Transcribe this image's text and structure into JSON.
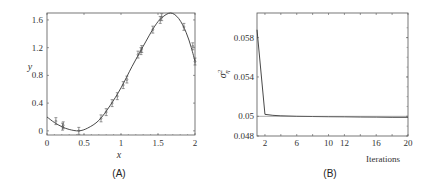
{
  "chart_data": [
    {
      "panel": "(A)",
      "type": "scatter",
      "title": "",
      "xlabel": "x",
      "ylabel": "y",
      "xlim": [
        0,
        2
      ],
      "ylim": [
        -0.06,
        1.7
      ],
      "xticks": [
        "0",
        "0.5",
        "1",
        "1.5",
        "2"
      ],
      "yticks": [
        "0",
        "0.4",
        "0.8",
        "1.2",
        "1.6"
      ],
      "grid": false,
      "series": [
        {
          "name": "fitted curve",
          "kind": "line",
          "x": [
            0,
            0.1,
            0.2,
            0.3,
            0.43,
            0.55,
            0.7,
            0.85,
            1.0,
            1.15,
            1.3,
            1.45,
            1.55,
            1.67,
            1.78,
            1.88,
            1.95,
            2.0
          ],
          "y": [
            0.2,
            0.12,
            0.06,
            0.02,
            0.0,
            0.04,
            0.15,
            0.36,
            0.62,
            0.93,
            1.22,
            1.5,
            1.63,
            1.7,
            1.62,
            1.42,
            1.2,
            1.0
          ]
        },
        {
          "name": "observations",
          "kind": "errorbar",
          "x": [
            0.12,
            0.21,
            0.22,
            0.43,
            0.73,
            0.8,
            0.88,
            0.95,
            1.03,
            1.08,
            1.23,
            1.27,
            1.28,
            1.43,
            1.53,
            1.55,
            1.85,
            1.97,
            2.0
          ],
          "y": [
            0.14,
            0.06,
            0.08,
            0.0,
            0.18,
            0.27,
            0.4,
            0.5,
            0.66,
            0.74,
            1.1,
            1.15,
            1.18,
            1.46,
            1.6,
            1.64,
            1.5,
            1.22,
            1.0
          ],
          "err": 0.05
        }
      ],
      "caption": "(A)"
    },
    {
      "panel": "(B)",
      "type": "line",
      "title": "",
      "xlabel": "Iterations",
      "ylabel": "σ²η",
      "xlim": [
        1,
        20
      ],
      "ylim": [
        0.048,
        0.0605
      ],
      "xticks": [
        "2",
        "6",
        "10",
        "12",
        "16",
        "20"
      ],
      "yticks": [
        "0.048",
        "0.05",
        "0.054",
        "0.058"
      ],
      "grid": false,
      "series": [
        {
          "name": "noise variance estimate",
          "x": [
            1,
            2,
            3,
            4,
            6,
            8,
            10,
            12,
            14,
            16,
            18,
            20
          ],
          "y": [
            0.0588,
            0.0502,
            0.0501,
            0.05005,
            0.05,
            0.04998,
            0.04996,
            0.04995,
            0.04993,
            0.04992,
            0.0499,
            0.0499
          ]
        },
        {
          "name": "reference line",
          "x": [
            1,
            20
          ],
          "y": [
            0.05,
            0.05
          ]
        }
      ],
      "caption": "(B)"
    }
  ],
  "labels": {
    "a_xlabel": "x",
    "a_ylabel": "y",
    "a_caption": "(A)",
    "b_xlabel": "Iterations",
    "b_ylabel_base": "σ",
    "b_ylabel_sup": "2",
    "b_ylabel_sub": "η",
    "b_caption": "(B)"
  },
  "colors": {
    "line": "#333333",
    "axis": "#555555",
    "points": "#555555"
  }
}
